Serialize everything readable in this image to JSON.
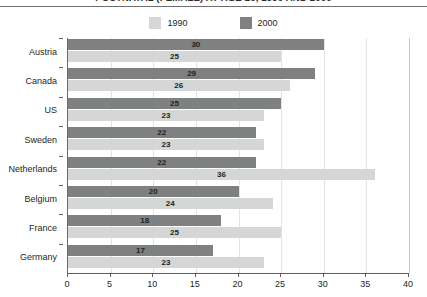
{
  "chart_data": {
    "type": "bar",
    "orientation": "horizontal",
    "title": "POSTNATAL (FEMALE) AT AGE 20, 1990 AND 2000",
    "xlabel": "",
    "ylabel": "",
    "xlim": [
      0,
      40
    ],
    "xticks": [
      0,
      5,
      10,
      15,
      20,
      25,
      30,
      35,
      40
    ],
    "xtick_labels": [
      "0",
      "5",
      "10",
      "15",
      "20",
      "25",
      "30",
      "35",
      "40"
    ],
    "grid": true,
    "legend_position": "top",
    "categories": [
      "Austria",
      "Canada",
      "US",
      "Sweden",
      "Netherlands",
      "Belgium",
      "France",
      "Germany"
    ],
    "series": [
      {
        "name": "1990",
        "color": "#d5d6d6",
        "values": [
          25,
          26,
          23,
          23,
          36,
          24,
          25,
          23
        ]
      },
      {
        "name": "2000",
        "color": "#7f8080",
        "values": [
          30,
          29,
          25,
          22,
          22,
          20,
          18,
          17
        ]
      }
    ]
  },
  "legend": {
    "items": [
      {
        "label": "1990",
        "color": "#d5d6d6"
      },
      {
        "label": "2000",
        "color": "#7f8080"
      }
    ]
  }
}
